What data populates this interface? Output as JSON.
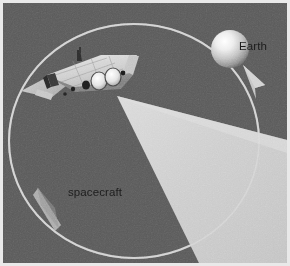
{
  "figure": {
    "type": "illustration",
    "background_color": "#5a5a5a",
    "frame_color": "#e9e9e9"
  },
  "labels": {
    "earth": "Earth",
    "spacecraft": "spacecraft"
  },
  "elements": {
    "earth_body": {
      "name": "earth-sphere",
      "center": [
        227,
        46
      ],
      "radius": 19,
      "highlight": "#ffffff",
      "shadow": "#6f6f6f"
    },
    "orbit": {
      "name": "orbit-path",
      "center": [
        131,
        138
      ],
      "radius_x": 125,
      "radius_y": 117,
      "color": "#c9c9c9",
      "width": 2
    },
    "orbit_arrow_top": {
      "name": "orbit-direction-arrow-earth",
      "position": [
        250,
        72
      ],
      "direction": "up-left",
      "color": "#c3c3c3"
    },
    "orbit_arrow_bottom": {
      "name": "orbit-direction-arrow-lower-left",
      "position": [
        47,
        205
      ],
      "direction": "down-right",
      "color": "#c0c0c0"
    },
    "beam": {
      "name": "transmission-beam",
      "apex": [
        114,
        93
      ],
      "color_near": "#d3d3d3",
      "color_far": "#c6c6c6",
      "spread_to": "bottom-right-edge"
    },
    "spacecraft": {
      "name": "spacecraft-body",
      "position": [
        18,
        52,
        122,
        50
      ],
      "hull_color": "#d8d8d8",
      "shade_color": "#8f8f8f",
      "engine_count": 3,
      "engine_color": "#f4f4f4"
    }
  },
  "colors": {
    "background": "#5a5a5a",
    "beam": "#cccccc",
    "orbit_line": "#c9c9c9",
    "text": "#1d1d1d",
    "hull": "#d8d8d8"
  }
}
